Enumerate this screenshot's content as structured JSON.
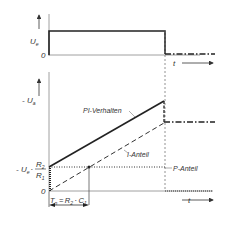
{
  "diagram": {
    "type": "PI controller step response",
    "top_graph": {
      "y_axis_label": "U_e",
      "y_axis_label_sub": "e",
      "y_axis_label_main": "U",
      "zero_label": "0",
      "x_axis_label": "t"
    },
    "bottom_graph": {
      "y_axis_label_main": "- U",
      "y_axis_label_sub": "a",
      "p_level_label_main": "- U",
      "p_level_label_sub": "e",
      "p_level_dot": "·",
      "fraction_num_main": "R",
      "fraction_num_sub": "2",
      "fraction_den_main": "R",
      "fraction_den_sub": "1",
      "zero_label": "0",
      "x_axis_label": "t",
      "curve_labels": {
        "pi": "PI-Verhalten",
        "i": "I-Anteil",
        "p": "P-Anteil"
      },
      "time_constant": {
        "lhs_main": "T",
        "lhs_sub": "n",
        "eq": "=",
        "r_main": "R",
        "r_sub": "2",
        "dot": "·",
        "c_main": "C",
        "c_sub": "1"
      }
    },
    "colors": {
      "line": "#222222",
      "axis": "#555555",
      "guide": "#777777"
    }
  }
}
